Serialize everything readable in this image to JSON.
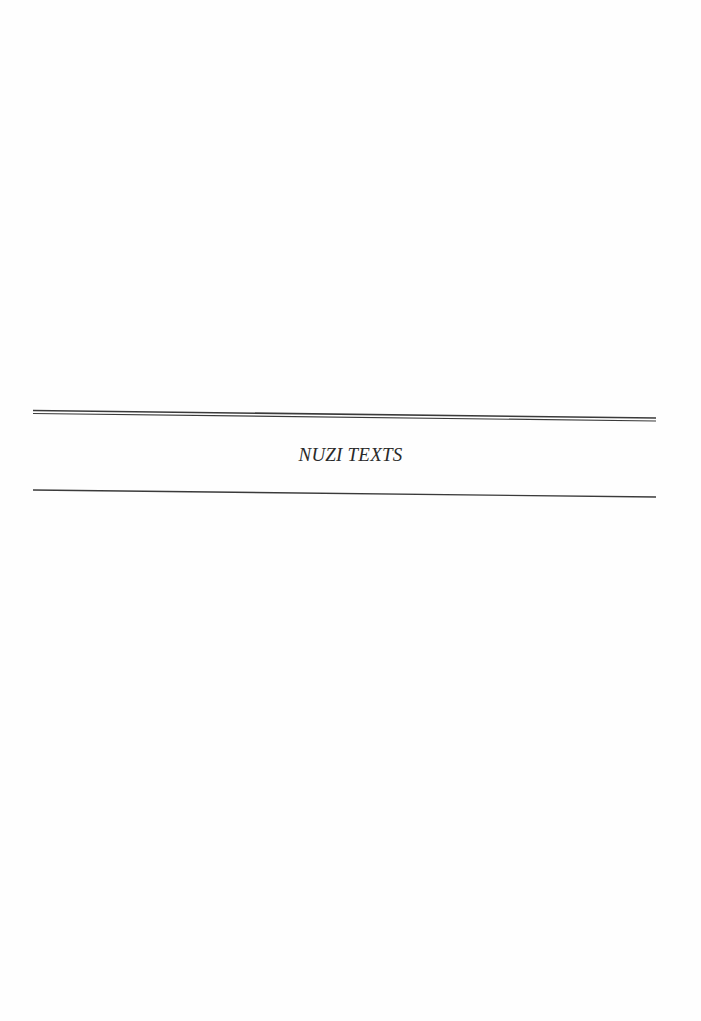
{
  "page": {
    "section_title": "NUZI TEXTS",
    "colors": {
      "background": "#fefefe",
      "rule": "#3a3a3a",
      "text": "#2a2a2a"
    }
  }
}
